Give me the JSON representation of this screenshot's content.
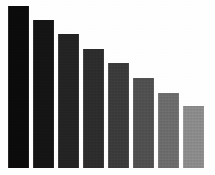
{
  "chart_data": {
    "type": "bar",
    "title": "",
    "subtitle": "",
    "xlabel": "",
    "ylabel": "",
    "categories": [
      "1",
      "2",
      "3",
      "4",
      "5",
      "6",
      "7",
      "8"
    ],
    "values": [
      162,
      148,
      134,
      119,
      105,
      90,
      75,
      62
    ],
    "ylim": [
      0,
      168
    ],
    "xlim": [
      0,
      215
    ],
    "grid": false,
    "legend": null,
    "axis_visible": false,
    "tick_labels_visible": false,
    "data_labels_visible": false,
    "bar_colors": [
      "#0b0b0b",
      "#141414",
      "#232323",
      "#2c2c2c",
      "#3a3a3a",
      "#4f4f4f",
      "#6b6b6b",
      "#8a8a8a"
    ],
    "background_color": "#fefefe",
    "bar_width_px": 21,
    "bar_gap_px": 4,
    "baseline_y_px": 168,
    "first_bar_left_px": 8,
    "annotations": []
  },
  "figure": {
    "width_px": 215,
    "height_px": 175
  }
}
